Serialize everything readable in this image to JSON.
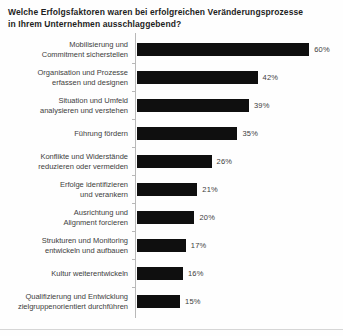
{
  "title": {
    "text": "Welche Erfolgsfaktoren waren bei erfolgreichen Veränderungsprozesse\nin Ihrem Unternehmen ausschlaggebend?"
  },
  "chart_data": {
    "type": "bar",
    "orientation": "horizontal",
    "title": "Welche Erfolgsfaktoren waren bei erfolgreichen Veränderungsprozesse in Ihrem Unternehmen ausschlaggebend?",
    "categories": [
      "Mobilisierung und\nCommitment sicherstellen",
      "Organisation und Prozesse\nerfassen und designen",
      "Situation und Umfeld\nanalysieren und verstehen",
      "Führung fördern",
      "Konflikte und Widerstände\nreduzieren oder vermeiden",
      "Erfolge identifizieren\nund verankern",
      "Ausrichtung und\nAlignment forcieren",
      "Strukturen und Monitoring\nentwickeln und aufbauen",
      "Kultur weiterentwickeln",
      "Qualifizierung und Entwicklung\nzielgruppenorientiert durchführen"
    ],
    "values": [
      60,
      42,
      39,
      35,
      26,
      21,
      20,
      17,
      16,
      15
    ],
    "value_labels": [
      "60%",
      "42%",
      "39%",
      "35%",
      "26%",
      "21%",
      "20%",
      "17%",
      "16%",
      "15%"
    ],
    "unit": "%",
    "xlim": [
      0,
      62
    ],
    "grid": false,
    "legend": false,
    "bar_color": "#0f0f0f",
    "axis_color": "#b8b8b8",
    "label_color": "#3d3d3d"
  }
}
